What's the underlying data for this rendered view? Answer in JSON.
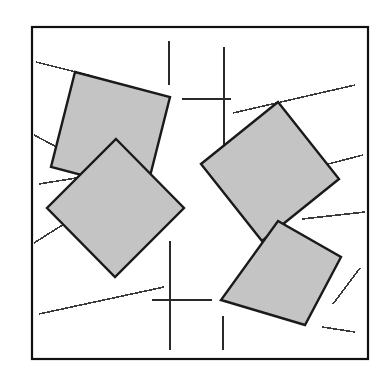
{
  "figure": {
    "canvas": {
      "width": 388,
      "height": 385
    },
    "background_color": "#ffffff"
  },
  "frame": {
    "name": "outer-border",
    "x": 32,
    "y": 27,
    "width": 336,
    "height": 332,
    "stroke_color": "#111111",
    "stroke_width": 2.2,
    "fill_color": "#ffffff"
  },
  "style": {
    "square_fill": "#c4c4c4",
    "square_stroke": "#1a1a1a",
    "square_stroke_width": 2.4,
    "line_stroke": "#3a3a3a",
    "line_stroke_width": 1.6,
    "crosshair_stroke": "#2a2a2a",
    "crosshair_stroke_width": 1.7
  },
  "chart_data": {
    "type": "diagram",
    "squares": [
      {
        "name": "square-upper-left",
        "label": "upper-left",
        "vertices": [
          [
            75,
            72
          ],
          [
            170,
            97
          ],
          [
            146,
            192
          ],
          [
            51,
            167
          ]
        ]
      },
      {
        "name": "square-upper-right",
        "label": "upper-right",
        "vertices": [
          [
            278,
            102
          ],
          [
            339,
            179
          ],
          [
            262,
            241
          ],
          [
            201,
            164
          ]
        ]
      },
      {
        "name": "square-lower-left",
        "label": "lower-left",
        "vertices": [
          [
            116,
            139
          ],
          [
            184,
            208
          ],
          [
            115,
            277
          ],
          [
            47,
            208
          ]
        ]
      },
      {
        "name": "square-lower-right",
        "label": "lower-right",
        "vertices": [
          [
            278,
            221
          ],
          [
            341,
            257
          ],
          [
            305,
            325
          ],
          [
            221,
            300
          ]
        ]
      }
    ],
    "key_points": {
      "center_crossing": [
        223,
        176
      ],
      "upper_notch_apex": [
        170,
        97
      ],
      "lower_notch_apex": [
        172,
        228
      ]
    },
    "tangent_lines": [
      {
        "name": "tangent-top-left-upper",
        "x1": 36,
        "y1": 62,
        "x2": 92,
        "y2": 76
      },
      {
        "name": "tangent-top-left-lower",
        "x1": 34,
        "y1": 135,
        "x2": 66,
        "y2": 152
      },
      {
        "name": "tangent-left-middle",
        "x1": 39,
        "y1": 184,
        "x2": 107,
        "y2": 173
      },
      {
        "name": "tangent-left-lower",
        "x1": 34,
        "y1": 243,
        "x2": 64,
        "y2": 224
      },
      {
        "name": "tangent-bottom-left-long",
        "x1": 39,
        "y1": 314,
        "x2": 164,
        "y2": 287
      },
      {
        "name": "tangent-top-right-long",
        "x1": 233,
        "y1": 113,
        "x2": 355,
        "y2": 85
      },
      {
        "name": "tangent-right-upper",
        "x1": 305,
        "y1": 170,
        "x2": 363,
        "y2": 155
      },
      {
        "name": "tangent-right-middle",
        "x1": 302,
        "y1": 219,
        "x2": 365,
        "y2": 212
      },
      {
        "name": "tangent-right-lower",
        "x1": 333,
        "y1": 304,
        "x2": 360,
        "y2": 268
      },
      {
        "name": "tangent-bottom-right",
        "x1": 322,
        "y1": 327,
        "x2": 355,
        "y2": 332
      }
    ],
    "crosshairs": [
      {
        "name": "crosshair-top",
        "vertical": {
          "x": 224,
          "y1": 47,
          "y2": 155
        },
        "horizontal": {
          "y": 99,
          "x1": 182,
          "x2": 231
        },
        "extra_vertical": {
          "x": 169,
          "y1": 41,
          "y2": 85
        }
      },
      {
        "name": "crosshair-bottom",
        "vertical": {
          "x": 170,
          "y1": 241,
          "y2": 350
        },
        "horizontal": {
          "y": 300,
          "x1": 152,
          "x2": 212
        },
        "extra_vertical": {
          "x": 223,
          "y1": 316,
          "y2": 350
        }
      }
    ],
    "counts": {
      "squares": 4,
      "tangent_lines": 10,
      "crosshairs": 2
    }
  }
}
